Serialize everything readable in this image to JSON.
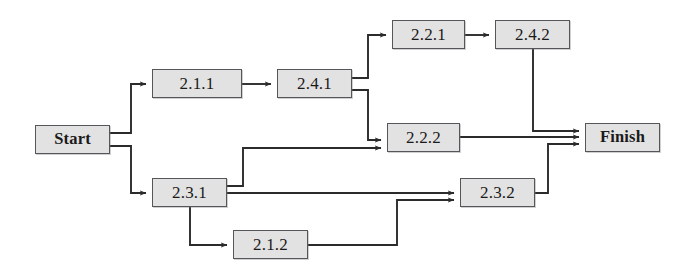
{
  "diagram": {
    "type": "flowchart",
    "canvas": {
      "width": 691,
      "height": 278
    },
    "style": {
      "node_fill": "#e2e2e2",
      "node_border": "#55565a",
      "edge_color": "#2b2b2b",
      "background": "#ffffff"
    },
    "nodes": [
      {
        "id": "start",
        "label": "Start",
        "kind": "terminal",
        "x": 35,
        "y": 125,
        "w": 75,
        "h": 29
      },
      {
        "id": "n211",
        "label": "2.1.1",
        "kind": "task",
        "x": 152,
        "y": 69,
        "w": 90,
        "h": 29
      },
      {
        "id": "n241",
        "label": "2.4.1",
        "kind": "task",
        "x": 277,
        "y": 69,
        "w": 75,
        "h": 29
      },
      {
        "id": "n221",
        "label": "2.2.1",
        "kind": "task",
        "x": 392,
        "y": 20,
        "w": 73,
        "h": 29
      },
      {
        "id": "n242",
        "label": "2.4.2",
        "kind": "task",
        "x": 495,
        "y": 20,
        "w": 75,
        "h": 29
      },
      {
        "id": "n222",
        "label": "2.2.2",
        "kind": "task",
        "x": 387,
        "y": 123,
        "w": 73,
        "h": 29
      },
      {
        "id": "n231",
        "label": "2.3.1",
        "kind": "task",
        "x": 152,
        "y": 178,
        "w": 75,
        "h": 29
      },
      {
        "id": "n232",
        "label": "2.3.2",
        "kind": "task",
        "x": 460,
        "y": 178,
        "w": 75,
        "h": 29
      },
      {
        "id": "n212",
        "label": "2.1.2",
        "kind": "task",
        "x": 233,
        "y": 230,
        "w": 75,
        "h": 29
      },
      {
        "id": "finish",
        "label": "Finish",
        "kind": "terminal",
        "x": 585,
        "y": 123,
        "w": 75,
        "h": 29
      }
    ],
    "edges": [
      {
        "from": "start",
        "to": "n211",
        "points": "110,133 131,133 131,84 146,84"
      },
      {
        "from": "n211",
        "to": "n241",
        "points": "242,84 271,84"
      },
      {
        "from": "n241",
        "to": "n221",
        "points": "352,78 368,78 368,35 386,35"
      },
      {
        "from": "n221",
        "to": "n242",
        "points": "465,35 489,35"
      },
      {
        "from": "n242",
        "to": "finish",
        "points": "533,49 533,131 579,131"
      },
      {
        "from": "n241",
        "to": "n222",
        "points": "352,90 368,90 368,140 381,140"
      },
      {
        "from": "n222",
        "to": "finish",
        "points": "460,137 579,137"
      },
      {
        "from": "start",
        "to": "n231",
        "points": "110,146 131,146 131,193 146,193"
      },
      {
        "from": "n231",
        "to": "n222",
        "points": "227,186 243,186 243,148 381,148"
      },
      {
        "from": "n231",
        "to": "n232",
        "points": "227,193 454,193"
      },
      {
        "from": "n231",
        "to": "n212",
        "points": "190,207 190,245 227,245"
      },
      {
        "from": "n212",
        "to": "n232",
        "points": "308,245 397,245 397,200 454,200"
      },
      {
        "from": "n232",
        "to": "finish",
        "points": "535,193 548,193 548,144 579,144"
      }
    ]
  }
}
